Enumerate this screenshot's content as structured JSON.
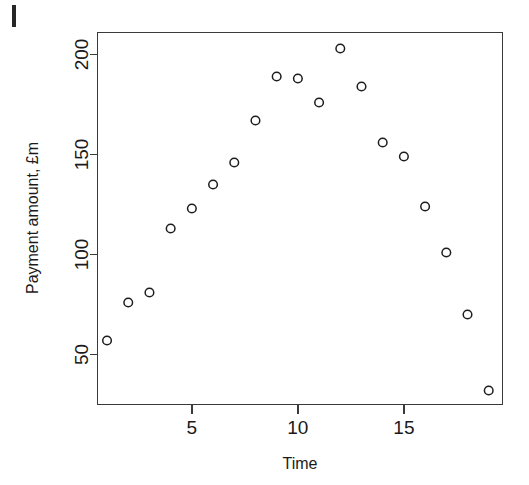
{
  "chart_data": {
    "type": "scatter",
    "title": "",
    "xlabel": "Time",
    "ylabel": "Payment amount, £m",
    "xlim": [
      0.55,
      19.65
    ],
    "ylim": [
      25,
      211
    ],
    "grid": false,
    "legend": null,
    "marker": "open-circle",
    "x": [
      1,
      2,
      3,
      4,
      5,
      6,
      7,
      8,
      9,
      10,
      11,
      12,
      13,
      14,
      15,
      16,
      17,
      18,
      19
    ],
    "y": [
      57,
      76,
      81,
      113,
      123,
      135,
      146,
      167,
      189,
      188,
      176,
      203,
      184,
      156,
      149,
      124,
      101,
      70,
      32
    ],
    "xticks": [
      5,
      10,
      15
    ],
    "xtick_labels": [
      "5",
      "10",
      "15"
    ],
    "yticks": [
      50,
      100,
      150,
      200
    ],
    "ytick_labels": [
      "50",
      "100",
      "150",
      "200"
    ],
    "colors": {
      "marker_stroke": "#1d1d1d",
      "axis": "#3a3a3a",
      "background": "#ffffff",
      "text": "#1a1a1a"
    }
  },
  "figure": {
    "x_axis_title": "Time",
    "y_axis_title": "Payment amount, £m"
  }
}
